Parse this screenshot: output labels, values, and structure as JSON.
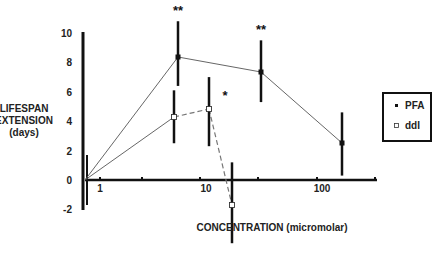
{
  "chart_data": {
    "type": "line",
    "title": "",
    "xlabel": "CONCENTRATION (micromolar)",
    "ylabel": [
      "LIFESPAN",
      "EXTENSION",
      "(days)"
    ],
    "x_scale": "log",
    "x_tick_labels": [
      "1",
      "10",
      "100"
    ],
    "y_ticks": [
      10,
      8,
      6,
      4,
      2,
      0,
      -2
    ],
    "ylim": [
      -2,
      10
    ],
    "legend": {
      "position": "right",
      "entries": [
        {
          "label": "PFA",
          "marker": "filled-square"
        },
        {
          "label": "ddI",
          "marker": "open-square"
        }
      ]
    },
    "series": [
      {
        "name": "PFA",
        "line": "solid",
        "points": [
          {
            "x": 0,
            "y": 0
          },
          {
            "x": 5,
            "y": 8.4,
            "err_low": 6.4,
            "err_high": 10.8,
            "significance": "**"
          },
          {
            "x": 30,
            "y": 7.3,
            "err_low": 5.3,
            "err_high": 9.5,
            "significance": "**"
          },
          {
            "x": 150,
            "y": 2.5,
            "err_low": 0.3,
            "err_high": 4.6
          }
        ]
      },
      {
        "name": "ddI",
        "line": "dashed-after-first-segment",
        "points": [
          {
            "x": 0,
            "y": 0
          },
          {
            "x": 5,
            "y": 4.4,
            "err_low": 2.5,
            "err_high": 6.1
          },
          {
            "x": 10,
            "y": 4.8,
            "err_low": 2.3,
            "err_high": 7.0,
            "significance": "*"
          },
          {
            "x": 17,
            "y": -1.8,
            "err_low": -4.3,
            "err_high": 1.2
          }
        ]
      }
    ]
  }
}
